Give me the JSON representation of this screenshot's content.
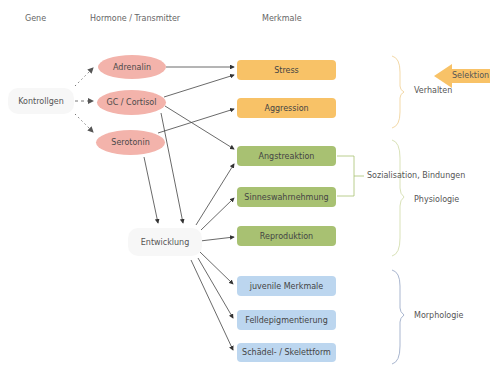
{
  "headers": {
    "gene": "Gene",
    "hormones": "Hormone / Transmitter",
    "traits": "Merkmale"
  },
  "genes": {
    "control": "Kontrollgen"
  },
  "hormones": [
    {
      "label": "Adrenalin"
    },
    {
      "label": "GC / Cortisol"
    },
    {
      "label": "Serotonin"
    }
  ],
  "development": "Entwicklung",
  "traits": [
    {
      "label": "Stress",
      "group": "behavior",
      "color": "#f8c267"
    },
    {
      "label": "Aggression",
      "group": "behavior",
      "color": "#f8c267"
    },
    {
      "label": "Angstreaktion",
      "group": "physiology",
      "color": "#a8c172"
    },
    {
      "label": "Sinneswahrnehmung",
      "group": "physiology",
      "color": "#a8c172"
    },
    {
      "label": "Reproduktion",
      "group": "physiology",
      "color": "#a8c172"
    },
    {
      "label": "juvenile Merkmale",
      "group": "morphology",
      "color": "#bcd6ef"
    },
    {
      "label": "Felldepigmentierung",
      "group": "morphology",
      "color": "#bcd6ef"
    },
    {
      "label": "Schädel- / Skelettform",
      "group": "morphology",
      "color": "#bcd6ef"
    }
  ],
  "groups": {
    "behavior": "Verhalten",
    "social": "Sozialisation, Bindungen",
    "physiology": "Physiologie",
    "morphology": "Morphologie"
  },
  "selection": {
    "label": "Selektion",
    "color": "#f8c267"
  },
  "colors": {
    "hormone": "#f3b3ab",
    "behavior": "#f8c267",
    "physiology": "#a8c172",
    "morphology": "#bcd6ef",
    "behavior_brace": "#f3d9a8",
    "physiology_brace": "#d9e2b8",
    "morphology_brace": "#a9b6cf"
  }
}
